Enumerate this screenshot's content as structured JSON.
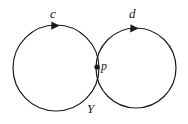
{
  "figure": {
    "kind": "wedge-of-two-circles",
    "stroke_color": "#1a1a1a",
    "background_color": "#ffffff",
    "stroke_width": 1.2,
    "labels": {
      "left_loop": "c",
      "right_loop": "d",
      "basepoint": "p",
      "space": "Y"
    },
    "left_circle": {
      "cx": 56,
      "cy": 68,
      "r": 43,
      "orientation": "counterclockwise-arrow-at-top-pointing-right"
    },
    "right_circle": {
      "cx": 136,
      "cy": 68,
      "r": 40,
      "orientation": "counterclockwise-arrow-at-top-pointing-right"
    },
    "basepoint_dot": {
      "cx": 97,
      "cy": 67,
      "r": 2.6
    },
    "arrowheads": [
      {
        "name": "c-direction-arrow",
        "x": 56,
        "y": 25,
        "direction": "right"
      },
      {
        "name": "d-direction-arrow",
        "x": 135,
        "y": 28,
        "direction": "right"
      }
    ]
  }
}
